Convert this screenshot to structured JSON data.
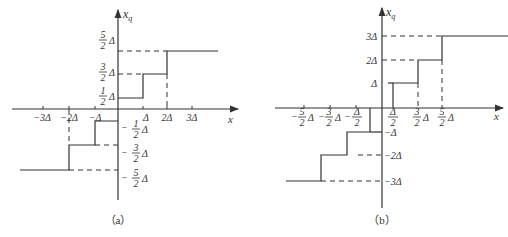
{
  "panels": [
    {
      "id": "a",
      "caption": "（a）",
      "y_axis_label": "x",
      "y_axis_sub": "q",
      "x_axis_label": "x",
      "x_ticks": [
        "−3Δ",
        "−2Δ",
        "−Δ",
        "Δ",
        "2Δ",
        "3Δ"
      ],
      "y_ticks_pos": [
        {
          "num": "1",
          "den": "2",
          "unit": "Δ",
          "sign": ""
        },
        {
          "num": "3",
          "den": "2",
          "unit": "Δ",
          "sign": ""
        },
        {
          "num": "5",
          "den": "2",
          "unit": "Δ",
          "sign": ""
        }
      ],
      "y_ticks_neg": [
        {
          "num": "1",
          "den": "2",
          "unit": "Δ",
          "sign": "−"
        },
        {
          "num": "3",
          "den": "2",
          "unit": "Δ",
          "sign": "−"
        },
        {
          "num": "5",
          "den": "2",
          "unit": "Δ",
          "sign": "−"
        }
      ],
      "quantizer": "mid-riser"
    },
    {
      "id": "b",
      "caption": "（b）",
      "y_axis_label": "x",
      "y_axis_sub": "q",
      "x_axis_label": "x",
      "x_ticks_neg": [
        {
          "sign": "−",
          "num": "5",
          "den": "2",
          "unit": "Δ"
        },
        {
          "sign": "−",
          "num": "3",
          "den": "2",
          "unit": "Δ"
        },
        {
          "sign": "−",
          "num": "Δ",
          "den": "2",
          "unit": ""
        }
      ],
      "x_ticks_pos": [
        {
          "sign": "",
          "num": "Δ",
          "den": "2",
          "unit": ""
        },
        {
          "sign": "",
          "num": "3",
          "den": "2",
          "unit": "Δ"
        },
        {
          "sign": "",
          "num": "5",
          "den": "2",
          "unit": "Δ"
        }
      ],
      "y_ticks": [
        "Δ",
        "2Δ",
        "3Δ",
        "−Δ",
        "−2Δ",
        "−3Δ"
      ],
      "quantizer": "mid-tread"
    }
  ]
}
